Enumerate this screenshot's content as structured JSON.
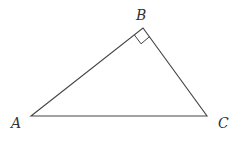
{
  "diagram": {
    "type": "right-triangle",
    "vertices": [
      {
        "label": "A",
        "x": 31,
        "y": 116
      },
      {
        "label": "B",
        "x": 143,
        "y": 28
      },
      {
        "label": "C",
        "x": 207,
        "y": 116
      }
    ],
    "right_angle_at": "B",
    "labels": {
      "a": "A",
      "b": "B",
      "c": "C"
    },
    "stroke_color": "#444444"
  }
}
